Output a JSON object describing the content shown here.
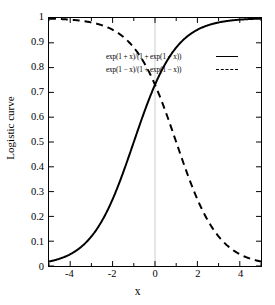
{
  "chart_data": {
    "type": "line",
    "title": "",
    "xlabel": "x",
    "ylabel": "Logistic curve",
    "xlim": [
      -5,
      5
    ],
    "ylim": [
      0,
      1
    ],
    "grid": false,
    "gridlines": {
      "vertical_at_x": 0,
      "color": "#cccccc"
    },
    "legend_position": "center-right",
    "xticks": [
      -4,
      -2,
      0,
      2,
      4
    ],
    "xtick_labels": [
      "-4",
      "-2",
      "0",
      "2",
      "4"
    ],
    "yticks": [
      0,
      0.1,
      0.2,
      0.3,
      0.4,
      0.5,
      0.6,
      0.7,
      0.8,
      0.9,
      1
    ],
    "ytick_labels": [
      "0",
      "0.1",
      "0.2",
      "0.3",
      "0.4",
      "0.5",
      "0.6",
      "0.7",
      "0.8",
      "0.9",
      "1"
    ],
    "intersection": {
      "x": 0,
      "y": 0.731
    },
    "series": [
      {
        "name": "exp(1 + x)/(1 + exp(1 + x))",
        "style": "solid",
        "color": "#000000",
        "x": [
          -5,
          -4.5,
          -4,
          -3.5,
          -3,
          -2.5,
          -2,
          -1.5,
          -1,
          -0.5,
          0,
          0.5,
          1,
          1.5,
          2,
          2.5,
          3,
          3.5,
          4,
          4.5,
          5
        ],
        "values": [
          0.018,
          0.0293,
          0.0474,
          0.0759,
          0.1192,
          0.1824,
          0.2689,
          0.3775,
          0.5,
          0.6225,
          0.7311,
          0.8176,
          0.8808,
          0.9241,
          0.9526,
          0.9707,
          0.982,
          0.989,
          0.9933,
          0.9959,
          0.9975
        ]
      },
      {
        "name": "exp(1 - x)/(1 + exp(1 - x))",
        "style": "dashed",
        "color": "#000000",
        "x": [
          -5,
          -4.5,
          -4,
          -3.5,
          -3,
          -2.5,
          -2,
          -1.5,
          -1,
          -0.5,
          0,
          0.5,
          1,
          1.5,
          2,
          2.5,
          3,
          3.5,
          4,
          4.5,
          5
        ],
        "values": [
          0.9975,
          0.9959,
          0.9933,
          0.989,
          0.982,
          0.9707,
          0.9526,
          0.9241,
          0.8808,
          0.8176,
          0.7311,
          0.6225,
          0.5,
          0.3775,
          0.2689,
          0.1824,
          0.1192,
          0.0759,
          0.0474,
          0.0293,
          0.018
        ]
      }
    ]
  },
  "legend": {
    "entries": [
      {
        "label": "exp(1 + x)/(1 + exp(1 + x))",
        "style": "solid"
      },
      {
        "label": "exp(1 − x)/(1 + exp(1 − x))",
        "style": "dashed"
      }
    ]
  },
  "axes": {
    "x_title": "x",
    "y_title": "Logistic curve"
  },
  "colors": {
    "curve": "#000000",
    "frame": "#000000",
    "gridline": "#cccccc",
    "background": "#ffffff"
  }
}
